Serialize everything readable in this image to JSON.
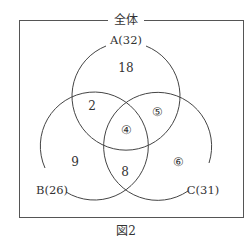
{
  "diagram": {
    "type": "venn",
    "universe_label": "全体",
    "caption": "図2",
    "sets": [
      {
        "name": "A",
        "label": "A(32)",
        "total": 32
      },
      {
        "name": "B",
        "label": "B(26)",
        "total": 26
      },
      {
        "name": "C",
        "label": "C(31)",
        "total": 31
      }
    ],
    "regions": {
      "A_only": "18",
      "A_and_B_only": "2",
      "A_and_C_only": "⑤",
      "A_and_B_and_C": "④",
      "B_only": "9",
      "B_and_C_only": "8",
      "C_only": "⑥"
    },
    "colors": {
      "line": "#555555",
      "text": "#333333",
      "background": "#ffffff"
    }
  }
}
